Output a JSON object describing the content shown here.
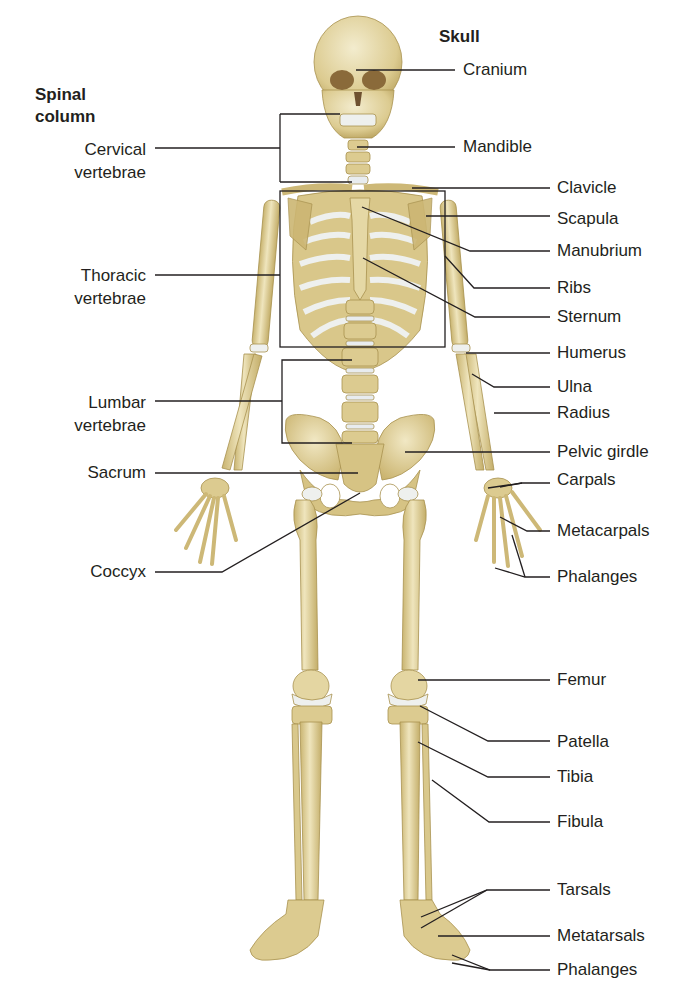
{
  "figure": {
    "type": "labeled anatomical illustration",
    "colors": {
      "background": "#ffffff",
      "bone": "#e2d49e",
      "bone_shade": "#c7b26e",
      "cartilage": "#e8ecef",
      "leader_line": "#231f20",
      "text": "#231f20"
    }
  },
  "headings": {
    "spinal_column": "Spinal\ncolumn",
    "spinal_column_line1": "Spinal",
    "spinal_column_line2": "column",
    "skull": "Skull"
  },
  "left_labels": [
    {
      "id": "cervical",
      "line1": "Cervical",
      "line2": "vertebrae"
    },
    {
      "id": "thoracic",
      "line1": "Thoracic",
      "line2": "vertebrae"
    },
    {
      "id": "lumbar",
      "line1": "Lumbar",
      "line2": "vertebrae"
    },
    {
      "id": "sacrum",
      "line1": "Sacrum"
    },
    {
      "id": "coccyx",
      "line1": "Coccyx"
    }
  ],
  "right_labels": [
    {
      "id": "cranium",
      "text": "Cranium"
    },
    {
      "id": "mandible",
      "text": "Mandible"
    },
    {
      "id": "clavicle",
      "text": "Clavicle"
    },
    {
      "id": "scapula",
      "text": "Scapula"
    },
    {
      "id": "manubrium",
      "text": "Manubrium"
    },
    {
      "id": "ribs",
      "text": "Ribs"
    },
    {
      "id": "sternum",
      "text": "Sternum"
    },
    {
      "id": "humerus",
      "text": "Humerus"
    },
    {
      "id": "ulna",
      "text": "Ulna"
    },
    {
      "id": "radius",
      "text": "Radius"
    },
    {
      "id": "pelvic-girdle",
      "text": "Pelvic girdle"
    },
    {
      "id": "carpals",
      "text": "Carpals"
    },
    {
      "id": "metacarpals",
      "text": "Metacarpals"
    },
    {
      "id": "phalanges-hand",
      "text": "Phalanges"
    },
    {
      "id": "femur",
      "text": "Femur"
    },
    {
      "id": "patella",
      "text": "Patella"
    },
    {
      "id": "tibia",
      "text": "Tibia"
    },
    {
      "id": "fibula",
      "text": "Fibula"
    },
    {
      "id": "tarsals",
      "text": "Tarsals"
    },
    {
      "id": "metatarsals",
      "text": "Metatarsals"
    },
    {
      "id": "phalanges-foot",
      "text": "Phalanges"
    }
  ]
}
